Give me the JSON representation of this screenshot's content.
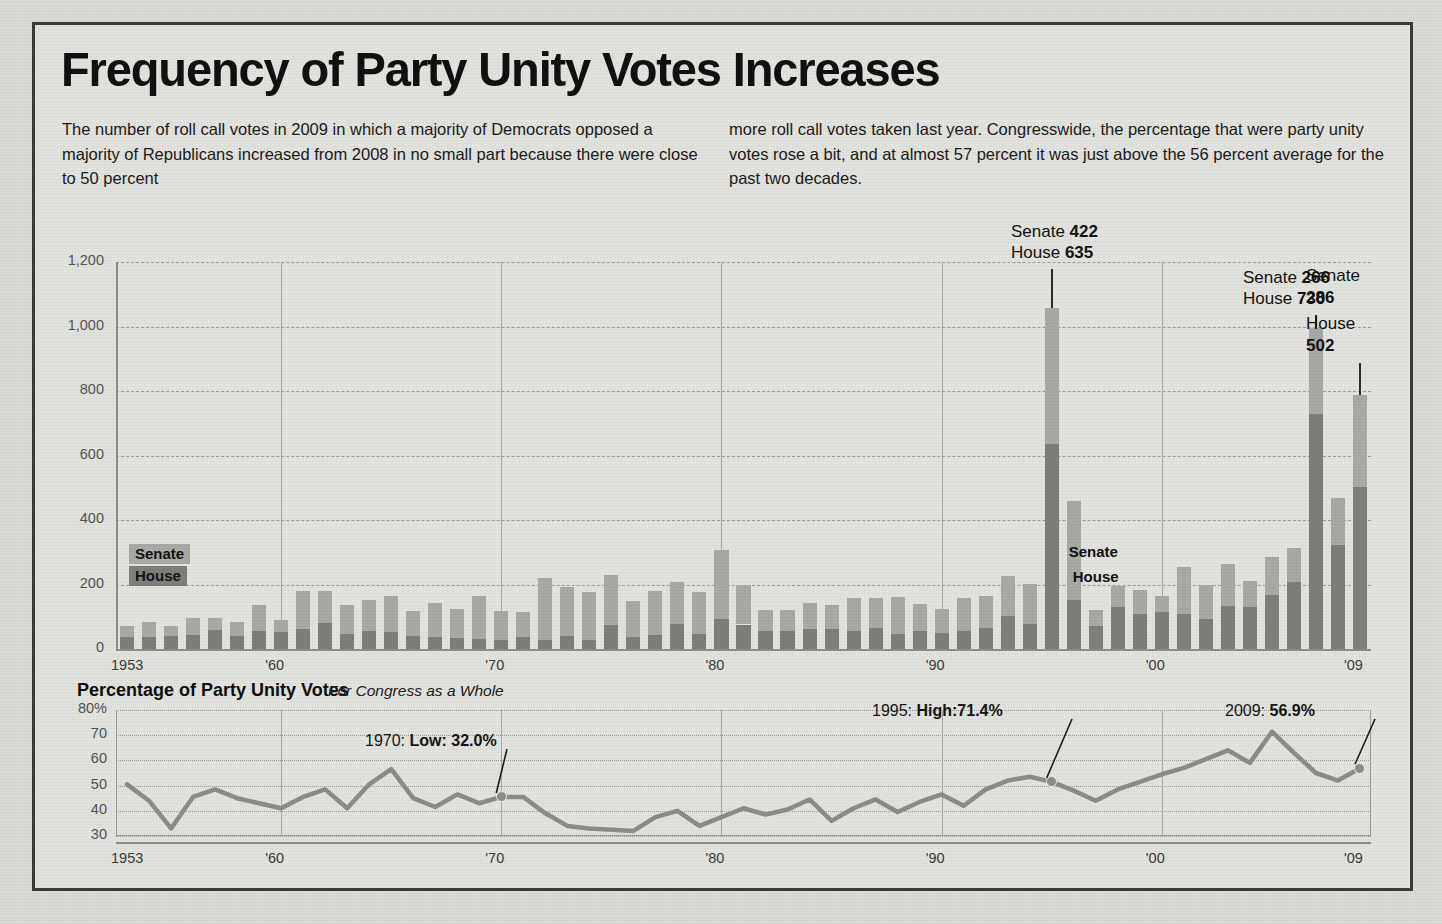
{
  "header": {
    "title": "Frequency of Party Unity Votes Increases",
    "intro_col1": "The number of roll call votes in 2009 in which a majority of Democrats opposed a majority of Republicans increased from 2008 in no small part because there were close to 50 percent",
    "intro_col2": "more roll call votes taken last year. Congresswide, the percentage that were party unity votes rose a bit, and at almost 57 percent it was just above the 56 percent average for the past two decades."
  },
  "legend": {
    "senate_label": "Senate",
    "house_label": "House",
    "senate_color": "#a9a9a5",
    "house_color": "#7e7e7a"
  },
  "inline_legend": {
    "senate_label": "Senate",
    "house_label": "House"
  },
  "callouts": [
    {
      "id": "c1995",
      "senate_prefix": "Senate",
      "senate_value": "422",
      "house_prefix": "House",
      "house_value": "635"
    },
    {
      "id": "c2007",
      "senate_prefix": "Senate",
      "senate_value": "266",
      "house_prefix": "House",
      "house_value": "730"
    },
    {
      "id": "c2009",
      "senate_prefix": "Senate",
      "senate_value": "286",
      "house_prefix": "House",
      "house_value": "502"
    }
  ],
  "line_section": {
    "heading": "Percentage of Party Unity Votes",
    "subheading": "For Congress as a Whole",
    "annotations": [
      {
        "year": "1970",
        "text": "1970: ",
        "label": "Low: ",
        "value": "32.0%"
      },
      {
        "year": "1995",
        "text": "1995: ",
        "label": "High:",
        "value": "71.4%"
      },
      {
        "year": "2009",
        "text": "2009: ",
        "label": "",
        "value": "56.9%"
      }
    ]
  },
  "chart_data": [
    {
      "type": "bar",
      "stacked": true,
      "title": "Frequency of Party Unity Votes",
      "xlabel": "",
      "ylabel": "",
      "ylim": [
        0,
        1200
      ],
      "yticks": [
        "0",
        "200",
        "400",
        "600",
        "800",
        "1,000",
        "1,200"
      ],
      "ytick_values": [
        0,
        200,
        400,
        600,
        800,
        1000,
        1200
      ],
      "xticks": [
        "1953",
        "'60",
        "'70",
        "'80",
        "'90",
        "'00",
        "'09"
      ],
      "xtick_years": [
        1953,
        1960,
        1970,
        1980,
        1990,
        2000,
        2009
      ],
      "grid": true,
      "legend_position": "inside-left",
      "categories": [
        1953,
        1954,
        1955,
        1956,
        1957,
        1958,
        1959,
        1960,
        1961,
        1962,
        1963,
        1964,
        1965,
        1966,
        1967,
        1968,
        1969,
        1970,
        1971,
        1972,
        1973,
        1974,
        1975,
        1976,
        1977,
        1978,
        1979,
        1980,
        1981,
        1982,
        1983,
        1984,
        1985,
        1986,
        1987,
        1988,
        1989,
        1990,
        1991,
        1992,
        1993,
        1994,
        1995,
        1996,
        1997,
        1998,
        1999,
        2000,
        2001,
        2002,
        2003,
        2004,
        2005,
        2006,
        2007,
        2008,
        2009
      ],
      "series": [
        {
          "name": "House",
          "color": "#7e7e7a",
          "values": [
            38,
            38,
            41,
            44,
            59,
            40,
            55,
            53,
            61,
            81,
            47,
            55,
            52,
            41,
            36,
            35,
            31,
            27,
            38,
            27,
            41,
            29,
            75,
            37,
            42,
            78,
            47,
            92,
            76,
            55,
            56,
            61,
            61,
            57,
            64,
            47,
            55,
            49,
            55,
            64,
            102,
            78,
            635,
            153,
            72,
            130,
            109,
            115,
            109,
            92,
            134,
            131,
            166,
            208,
            730,
            322,
            502
          ]
        },
        {
          "name": "Senate",
          "color": "#a9a9a5",
          "values": [
            34,
            47,
            30,
            53,
            36,
            44,
            83,
            37,
            118,
            98,
            89,
            97,
            112,
            78,
            107,
            90,
            133,
            92,
            76,
            194,
            150,
            148,
            153,
            113,
            138,
            130,
            129,
            215,
            121,
            67,
            66,
            83,
            76,
            100,
            94,
            113,
            84,
            74,
            102,
            101,
            125,
            123,
            422,
            306,
            50,
            65,
            74,
            49,
            146,
            108,
            131,
            80,
            119,
            106,
            266,
            147,
            286
          ]
        }
      ],
      "annotated_points": [
        {
          "year": 1995,
          "senate": 422,
          "house": 635
        },
        {
          "year": 2007,
          "senate": 266,
          "house": 730
        },
        {
          "year": 2009,
          "senate": 286,
          "house": 502
        }
      ]
    },
    {
      "type": "line",
      "title": "Percentage of Party Unity Votes",
      "subtitle": "For Congress as a Whole",
      "xlabel": "",
      "ylabel": "",
      "ylim": [
        30,
        80
      ],
      "yticks": [
        "30",
        "40",
        "50",
        "60",
        "70",
        "80%"
      ],
      "ytick_values": [
        30,
        40,
        50,
        60,
        70,
        80
      ],
      "xticks": [
        "1953",
        "'60",
        "'70",
        "'80",
        "'90",
        "'00",
        "'09"
      ],
      "grid": true,
      "line_color": "#8c8c88",
      "x": [
        1953,
        1954,
        1955,
        1956,
        1957,
        1958,
        1959,
        1960,
        1961,
        1962,
        1963,
        1964,
        1965,
        1966,
        1967,
        1968,
        1969,
        1970,
        1971,
        1972,
        1973,
        1974,
        1975,
        1976,
        1977,
        1978,
        1979,
        1980,
        1981,
        1982,
        1983,
        1984,
        1985,
        1986,
        1987,
        1988,
        1989,
        1990,
        1991,
        1992,
        1993,
        1994,
        1995,
        1996,
        1997,
        1998,
        1999,
        2000,
        2001,
        2002,
        2003,
        2004,
        2005,
        2006,
        2007,
        2008,
        2009
      ],
      "values": [
        50.5,
        44.0,
        33.0,
        45.5,
        48.5,
        45.0,
        43.0,
        41.0,
        45.5,
        48.5,
        41.0,
        50.5,
        56.5,
        45.0,
        41.5,
        46.5,
        43.0,
        45.5,
        45.5,
        39.0,
        34.0,
        33.0,
        32.5,
        32.0,
        37.5,
        40.0,
        34.0,
        37.5,
        41.0,
        38.5,
        40.5,
        44.5,
        36.0,
        41.0,
        44.5,
        39.5,
        43.5,
        46.5,
        42.0,
        48.5,
        52.0,
        53.5,
        51.5,
        48.0,
        44.0,
        48.5,
        51.5,
        54.5,
        57.0,
        60.5,
        64.0,
        59.0,
        71.4,
        63.0,
        55.0,
        52.0,
        56.9
      ],
      "annotated_points": [
        {
          "year": 1970,
          "value": 32.0,
          "label": "Low: 32.0%"
        },
        {
          "year": 1995,
          "value": 71.4,
          "label": "High:71.4%"
        },
        {
          "year": 2009,
          "value": 56.9,
          "label": "56.9%"
        }
      ]
    }
  ]
}
